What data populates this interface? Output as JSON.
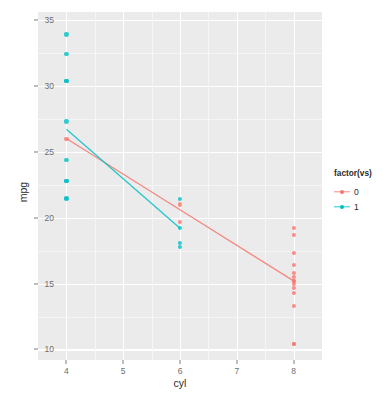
{
  "chart_data": {
    "type": "scatter",
    "title": "",
    "xlabel": "cyl",
    "ylabel": "mpg",
    "xlim": [
      3.5,
      8.5
    ],
    "ylim": [
      9.2,
      35.6
    ],
    "xticks": [
      4,
      5,
      6,
      7,
      8
    ],
    "yticks": [
      10,
      15,
      20,
      25,
      30,
      35
    ],
    "xtick_labels": [
      "4",
      "5",
      "6",
      "7",
      "8"
    ],
    "ytick_labels": [
      "10",
      "15",
      "20",
      "25",
      "30",
      "35"
    ],
    "grid": true,
    "legend": {
      "title": "factor(vs)",
      "position": "right",
      "entries": [
        {
          "label": "0",
          "color": "#f8766d"
        },
        {
          "label": "1",
          "color": "#00bfc4"
        }
      ]
    },
    "series": [
      {
        "name": "0",
        "color": "#f8766d",
        "points": [
          {
            "x": 4,
            "y": 26.0
          },
          {
            "x": 6,
            "y": 21.0
          },
          {
            "x": 6,
            "y": 19.7
          },
          {
            "x": 8,
            "y": 19.2
          },
          {
            "x": 8,
            "y": 18.7
          },
          {
            "x": 8,
            "y": 17.3
          },
          {
            "x": 8,
            "y": 16.4
          },
          {
            "x": 8,
            "y": 15.8
          },
          {
            "x": 8,
            "y": 15.5
          },
          {
            "x": 8,
            "y": 15.2
          },
          {
            "x": 8,
            "y": 15.2
          },
          {
            "x": 8,
            "y": 15.0
          },
          {
            "x": 8,
            "y": 14.7
          },
          {
            "x": 8,
            "y": 14.3
          },
          {
            "x": 8,
            "y": 13.3
          },
          {
            "x": 8,
            "y": 10.4
          },
          {
            "x": 8,
            "y": 10.4
          }
        ],
        "fit_line": [
          {
            "x": 4,
            "y": 26.0
          },
          {
            "x": 6,
            "y": 20.6
          },
          {
            "x": 8,
            "y": 15.2
          }
        ]
      },
      {
        "name": "1",
        "color": "#00bfc4",
        "points": [
          {
            "x": 4,
            "y": 33.9
          },
          {
            "x": 4,
            "y": 32.4
          },
          {
            "x": 4,
            "y": 30.4
          },
          {
            "x": 4,
            "y": 30.4
          },
          {
            "x": 4,
            "y": 27.3
          },
          {
            "x": 4,
            "y": 24.4
          },
          {
            "x": 4,
            "y": 22.8
          },
          {
            "x": 4,
            "y": 22.8
          },
          {
            "x": 4,
            "y": 21.5
          },
          {
            "x": 4,
            "y": 21.4
          },
          {
            "x": 6,
            "y": 21.4
          },
          {
            "x": 6,
            "y": 19.2
          },
          {
            "x": 6,
            "y": 18.1
          },
          {
            "x": 6,
            "y": 17.8
          }
        ],
        "fit_line": [
          {
            "x": 4,
            "y": 26.7
          },
          {
            "x": 6,
            "y": 19.2
          }
        ]
      }
    ]
  },
  "theme": {
    "panel_background": "#ebebeb",
    "grid_major_color": "#ffffff",
    "grid_minor_color": "#f7f7f7",
    "axis_text_color": "#6e6e6e",
    "axis_title_color": "#2b2b2b",
    "plot_background": "#ffffff"
  }
}
